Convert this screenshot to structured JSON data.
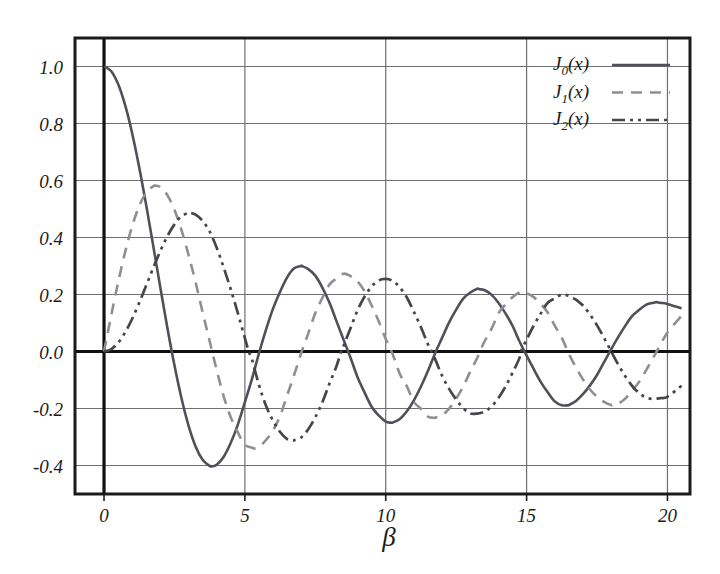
{
  "figure": {
    "background_color": "#ffffff",
    "frame_color": "#1b1b1b",
    "grid_color": "#6f6f72",
    "axis_color": "#111111"
  },
  "legend": {
    "position": "top-right-inside",
    "entries": [
      {
        "base": "J",
        "sub": "0",
        "arg": "(x)",
        "label": "J_0(x)",
        "style": "solid",
        "color": "#50505a"
      },
      {
        "base": "J",
        "sub": "1",
        "arg": "(x)",
        "label": "J_1(x)",
        "style": "dashed",
        "color": "#8e8e96"
      },
      {
        "base": "J",
        "sub": "2",
        "arg": "(x)",
        "label": "J_2(x)",
        "style": "dash-dot-dot",
        "color": "#45454c"
      }
    ]
  },
  "chart_data": {
    "type": "line",
    "title": "",
    "subtitle": "",
    "xlabel": "β",
    "ylabel": "",
    "xlim": [
      -1.03,
      20.8
    ],
    "ylim": [
      -0.5,
      1.1
    ],
    "xticks": [
      0,
      5,
      10,
      15,
      20
    ],
    "xtick_labels": [
      "0",
      "5",
      "10",
      "15",
      "20"
    ],
    "yticks": [
      1.0,
      0.8,
      0.6,
      0.4,
      0.2,
      0.0,
      -0.2,
      -0.4
    ],
    "ytick_labels": [
      "1.0",
      "0.8",
      "0.6",
      "0.4",
      "0.2",
      "0.0",
      "-0.2",
      "-0.4"
    ],
    "grid": true,
    "grid_axes": "both",
    "legend_position": "upper right",
    "annotations": [],
    "series": [
      {
        "name": "J_0(x)",
        "style": "solid",
        "color": "#50505a",
        "width": 2.6,
        "x": [
          0,
          0.25,
          0.5,
          0.75,
          1,
          1.25,
          1.5,
          1.75,
          2,
          2.25,
          2.5,
          2.75,
          3,
          3.25,
          3.5,
          3.75,
          3.8317,
          4,
          4.25,
          4.5,
          4.75,
          5,
          5.25,
          5.5,
          5.75,
          6,
          6.25,
          6.5,
          6.75,
          7,
          7.0156,
          7.25,
          7.5,
          7.75,
          8,
          8.25,
          8.5,
          8.75,
          9,
          9.25,
          9.5,
          9.75,
          10,
          10.1735,
          10.25,
          10.5,
          10.75,
          11,
          11.25,
          11.5,
          11.75,
          12,
          12.25,
          12.5,
          12.75,
          13,
          13.25,
          13.3237,
          13.5,
          13.75,
          14,
          14.25,
          14.5,
          14.75,
          15,
          15.25,
          15.5,
          15.75,
          16,
          16.25,
          16.47,
          16.5,
          16.75,
          17,
          17.25,
          17.5,
          17.75,
          18,
          18.25,
          18.5,
          18.75,
          19,
          19.25,
          19.5,
          19.6159,
          19.75,
          20,
          20.5
        ],
        "y": [
          1.0,
          0.9844,
          0.9385,
          0.8642,
          0.7652,
          0.6459,
          0.5118,
          0.369,
          0.2239,
          0.0827,
          -0.0484,
          -0.1641,
          -0.2601,
          -0.3331,
          -0.3801,
          -0.4014,
          -0.4028,
          -0.3971,
          -0.3691,
          -0.3205,
          -0.2566,
          -0.1776,
          -0.0968,
          -0.0068,
          0.0766,
          0.1506,
          0.2097,
          0.2601,
          0.2918,
          0.3001,
          0.3001,
          0.2891,
          0.2663,
          0.2244,
          0.1717,
          0.1066,
          0.0419,
          -0.0217,
          -0.0903,
          -0.1443,
          -0.1939,
          -0.2243,
          -0.2459,
          -0.2497,
          -0.249,
          -0.2366,
          -0.2097,
          -0.1712,
          -0.123,
          -0.0677,
          -0.0068,
          0.0477,
          0.1024,
          0.1469,
          0.1855,
          0.2069,
          0.2202,
          0.2184,
          0.2159,
          0.1995,
          0.1711,
          0.1336,
          0.0904,
          0.0349,
          -0.0142,
          -0.0613,
          -0.1063,
          -0.143,
          -0.1749,
          -0.1886,
          -0.1887,
          -0.188,
          -0.1737,
          -0.1499,
          -0.1189,
          -0.0823,
          -0.0374,
          0.0074,
          0.0503,
          0.0899,
          0.1247,
          0.1466,
          0.1644,
          0.1711,
          0.1732,
          0.1707,
          0.167,
          0.1515
        ]
      },
      {
        "name": "J_1(x)",
        "style": "dashed",
        "color": "#8e8e96",
        "width": 2.6,
        "dash": "11,8",
        "x": [
          0,
          0.25,
          0.5,
          0.75,
          1,
          1.25,
          1.5,
          1.75,
          1.8412,
          2,
          2.25,
          2.5,
          2.75,
          3,
          3.25,
          3.5,
          3.75,
          4,
          4.25,
          4.5,
          4.75,
          5,
          5.25,
          5.3314,
          5.5,
          5.75,
          6,
          6.25,
          6.5,
          6.75,
          7,
          7.25,
          7.5,
          7.75,
          8,
          8.25,
          8.5,
          8.75,
          9,
          9.25,
          9.5,
          9.75,
          10,
          10.25,
          10.5,
          10.75,
          11,
          11.25,
          11.5,
          11.706,
          11.75,
          12,
          12.25,
          12.5,
          12.75,
          13,
          13.25,
          13.5,
          13.75,
          14,
          14.25,
          14.5,
          14.75,
          14.8636,
          15,
          15.25,
          15.5,
          15.75,
          16,
          16.25,
          16.5,
          16.75,
          17,
          17.25,
          17.5,
          17.75,
          18,
          18.0711,
          18.25,
          18.5,
          18.75,
          19,
          19.25,
          19.5,
          19.75,
          20,
          20.5
        ],
        "y": [
          0.0,
          0.124,
          0.2423,
          0.3492,
          0.4401,
          0.5106,
          0.5579,
          0.5802,
          0.5819,
          0.5767,
          0.5484,
          0.4971,
          0.4256,
          0.3391,
          0.243,
          0.1374,
          0.036,
          -0.066,
          -0.158,
          -0.2311,
          -0.2839,
          -0.3276,
          -0.3371,
          -0.3403,
          -0.3353,
          -0.3106,
          -0.2767,
          -0.226,
          -0.1538,
          -0.0817,
          -0.0047,
          0.0635,
          0.1352,
          0.188,
          0.2346,
          0.2559,
          0.2731,
          0.2643,
          0.2453,
          0.211,
          0.1613,
          0.1061,
          0.0435,
          -0.0104,
          -0.0789,
          -0.1223,
          -0.1768,
          -0.2008,
          -0.2284,
          -0.2325,
          -0.2323,
          -0.2234,
          -0.2002,
          -0.1655,
          -0.123,
          -0.0703,
          -0.0219,
          0.0341,
          0.0783,
          0.1334,
          0.1653,
          0.1907,
          0.2069,
          0.2069,
          0.2051,
          0.1907,
          0.167,
          0.1369,
          0.0904,
          0.0477,
          -0.0079,
          -0.0556,
          -0.0977,
          -0.1334,
          -0.1585,
          -0.1766,
          -0.188,
          -0.188,
          -0.1832,
          -0.1653,
          -0.1359,
          -0.1057,
          -0.0645,
          -0.0206,
          0.0233,
          0.0668,
          0.1255
        ]
      },
      {
        "name": "J_2(x)",
        "style": "dash-dot-dot",
        "color": "#45454c",
        "width": 2.7,
        "dash": "13,5,3,5,3,5",
        "x": [
          0,
          0.25,
          0.5,
          0.75,
          1,
          1.25,
          1.5,
          1.75,
          2,
          2.25,
          2.5,
          2.75,
          3,
          3.0542,
          3.25,
          3.5,
          3.75,
          4,
          4.25,
          4.5,
          4.75,
          5,
          5.1356,
          5.25,
          5.5,
          5.75,
          6,
          6.25,
          6.5,
          6.7061,
          6.75,
          7,
          7.25,
          7.5,
          7.75,
          8,
          8.25,
          8.4172,
          8.5,
          8.75,
          9,
          9.25,
          9.5,
          9.75,
          10,
          10.25,
          10.5,
          10.75,
          11,
          11.25,
          11.5,
          11.6198,
          11.75,
          12,
          12.25,
          12.5,
          12.75,
          13,
          13.25,
          13.5,
          13.75,
          14,
          14.25,
          14.5,
          14.75,
          14.796,
          15,
          15.25,
          15.5,
          15.75,
          16,
          16.25,
          16.5,
          16.6983,
          16.75,
          17,
          17.25,
          17.5,
          17.75,
          18,
          18.25,
          18.5,
          18.75,
          19,
          19.25,
          19.5,
          19.75,
          20,
          20.5
        ],
        "y": [
          0.0,
          0.0078,
          0.0306,
          0.067,
          0.1149,
          0.1711,
          0.2321,
          0.294,
          0.3528,
          0.4049,
          0.4461,
          0.4747,
          0.4861,
          0.4863,
          0.4804,
          0.4586,
          0.4211,
          0.3641,
          0.294,
          0.2178,
          0.135,
          0.0466,
          0.0,
          -0.0268,
          -0.1173,
          -0.1905,
          -0.2429,
          -0.2826,
          -0.3074,
          -0.3114,
          -0.3112,
          -0.3014,
          -0.2727,
          -0.2306,
          -0.1781,
          -0.113,
          -0.0518,
          0.0,
          0.0194,
          0.0818,
          0.1448,
          0.193,
          0.2282,
          0.2493,
          0.2546,
          0.2476,
          0.225,
          0.1894,
          0.139,
          0.0852,
          0.0248,
          0.0,
          -0.026,
          -0.0849,
          -0.1312,
          -0.1688,
          -0.1986,
          -0.2177,
          -0.2177,
          -0.2113,
          -0.193,
          -0.1634,
          -0.1231,
          -0.075,
          -0.0224,
          0.0,
          0.0416,
          0.0904,
          0.133,
          0.1712,
          0.1862,
          0.1998,
          0.1952,
          0.185,
          0.1822,
          0.1613,
          0.13,
          0.0916,
          0.0477,
          0.0007,
          -0.0452,
          -0.0869,
          -0.1213,
          -0.1464,
          -0.1619,
          -0.1666,
          -0.1634,
          -0.159,
          -0.12
        ]
      }
    ]
  }
}
